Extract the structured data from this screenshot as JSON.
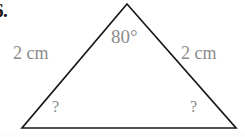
{
  "problem": {
    "number_label": "6.",
    "shape": "triangle"
  },
  "figure": {
    "apex_angle_label": "80°",
    "left_side_label": "2 cm",
    "right_side_label": "2 cm",
    "left_base_angle_label": "?",
    "right_base_angle_label": "?"
  },
  "style": {
    "line_color": "#1a1a1a",
    "label_color": "#8c8c8c",
    "number_color": "#111111",
    "background": "#ffffff"
  },
  "geometry": {
    "apex": {
      "x": 127,
      "y": 4
    },
    "bottom_left": {
      "x": 22,
      "y": 128
    },
    "bottom_right": {
      "x": 236,
      "y": 128
    }
  }
}
